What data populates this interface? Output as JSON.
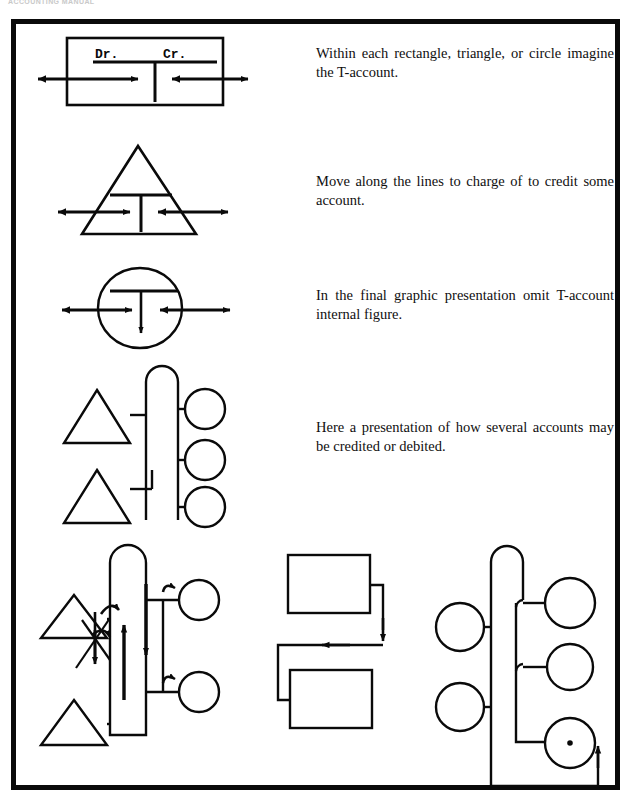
{
  "page": {
    "header_note": "ACCOUNTING MANUAL",
    "background_color": "#ffffff",
    "ink_color": "#0a0a0a",
    "border_color": "#0a0a0a"
  },
  "figure": {
    "legend_labels": {
      "debit": "Dr.",
      "credit": "Cr."
    },
    "captions": [
      {
        "id": "caption-rectangle-triangle-circle",
        "text": "Within each rectangle, triangle, or circle imagine the T-account."
      },
      {
        "id": "caption-move-along-lines",
        "text": "Move along the lines to charge of to credit some account."
      },
      {
        "id": "caption-omit-internal-figure",
        "text": "In the final graphic presentation omit T-account internal figure."
      },
      {
        "id": "caption-several-accounts",
        "text": "Here a presentation of how several accounts may be credited or debited."
      }
    ],
    "diagrams": [
      {
        "id": "diagram-rectangle-taccount",
        "shape": "rectangle",
        "shows_t_account": true,
        "arrow_count": 2
      },
      {
        "id": "diagram-triangle-taccount",
        "shape": "triangle",
        "shows_t_account": true,
        "arrow_count": 2
      },
      {
        "id": "diagram-circle-taccount",
        "shape": "circle",
        "shows_t_account": true,
        "arrow_count": 2
      },
      {
        "id": "diagram-multi-account-network",
        "shape": "network",
        "triangles": 2,
        "circles": 3,
        "shows_t_account": false
      },
      {
        "id": "diagram-annotated-flow",
        "shape": "network",
        "triangles": 2,
        "circles": 2,
        "has_flow_arrows": true,
        "has_crossed_out_mark": true
      },
      {
        "id": "diagram-two-rectangles-loop",
        "shape": "rectangles",
        "rectangles": 2,
        "arrow_count": 2
      },
      {
        "id": "diagram-circle-bus-loop",
        "shape": "network",
        "circles": 5,
        "arrow_count": 1
      }
    ]
  }
}
